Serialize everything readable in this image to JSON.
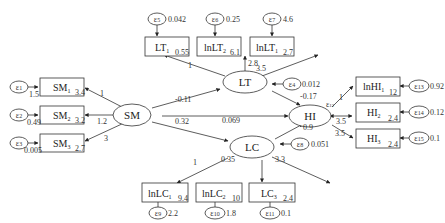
{
  "diagram": {
    "type": "structural-equation-model",
    "latent": {
      "SM": {
        "label": "SM"
      },
      "LT": {
        "label": "LT"
      },
      "LC": {
        "label": "LC"
      },
      "HI": {
        "label": "HI"
      }
    },
    "indicators": {
      "SM1": {
        "label": "SM",
        "sub": "1",
        "intercept": "3.4",
        "error": "1",
        "error_var": "1.5",
        "loading": "1"
      },
      "SM2": {
        "label": "SM",
        "sub": "2",
        "intercept": "3.2",
        "error": "2",
        "error_var": "0.49",
        "loading": "1.2"
      },
      "SM3": {
        "label": "SM",
        "sub": "3",
        "intercept": "2.7",
        "error": "3",
        "error_var": "0.005",
        "loading": "3"
      },
      "LT1": {
        "label": "LT",
        "sub": "1",
        "intercept": "0.55",
        "error": "5",
        "error_var": "0.042",
        "loading": "1"
      },
      "LT2": {
        "label": "lnLT",
        "sub": "2",
        "intercept": "6.1",
        "error": "6",
        "error_var": "0.25",
        "loading": "2.8"
      },
      "LT3": {
        "label": "lnLT",
        "sub": "1",
        "intercept": "2.7",
        "error": "7",
        "error_var": "4.6",
        "loading": "3.5"
      },
      "HI1": {
        "label": "lnHI",
        "sub": "1",
        "intercept": "12",
        "error": "13",
        "error_var": "0.92",
        "loading": "1"
      },
      "HI2": {
        "label": "HI",
        "sub": "2",
        "intercept": "2.4",
        "error": "14",
        "error_var": "0.12",
        "loading": "3.5"
      },
      "HI3": {
        "label": "HI",
        "sub": "3",
        "intercept": "2.4",
        "error": "15",
        "error_var": "0.1",
        "loading": "3.5"
      },
      "LC1": {
        "label": "lnLC",
        "sub": "1",
        "intercept": "9.4",
        "error": "9",
        "error_var": "2.2",
        "loading": "1"
      },
      "LC2": {
        "label": "lnLC",
        "sub": "2",
        "intercept": "10",
        "error": "10",
        "error_var": "1.8",
        "loading": "0.35"
      },
      "LC3": {
        "label": "LC",
        "sub": "3",
        "intercept": "2.4",
        "error": "11",
        "error_var": "0.1",
        "loading": "3.3"
      }
    },
    "structural_paths": {
      "SM_LT": "-0.11",
      "SM_LC": "0.32",
      "SM_HI": "0.069",
      "LT_HI": "-0.17",
      "LC_HI": "0.9"
    },
    "latent_errors": {
      "LT": {
        "error": "4",
        "var": "0.012"
      },
      "LC": {
        "error": "8",
        "var": "0.051"
      },
      "HI": {
        "error": "12"
      }
    },
    "epsilon_symbol": "ε"
  }
}
